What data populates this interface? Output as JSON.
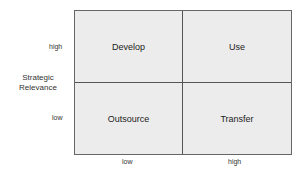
{
  "matrix": {
    "quadrants": {
      "top_left": "Develop",
      "top_right": "Use",
      "bottom_left": "Outsource",
      "bottom_right": "Transfer"
    }
  },
  "y_axis": {
    "label_line1": "Strategic",
    "label_line2": "Relevance",
    "high": "high",
    "low": "low"
  },
  "x_axis": {
    "low": "low",
    "high": "high"
  }
}
